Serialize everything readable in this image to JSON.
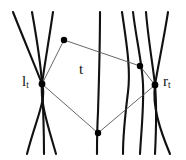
{
  "figure": {
    "background": "#ffffff",
    "width": 186,
    "height": 160,
    "curve_color": "#111111",
    "polygon_color": "#555555",
    "node_color": "#000000"
  },
  "labels": {
    "left_node": {
      "base": "l",
      "sub": "t",
      "x": 22,
      "y": 74
    },
    "right_node": {
      "base": "r",
      "sub": "t",
      "x": 163,
      "y": 74
    },
    "region": {
      "base": "t",
      "sub": "",
      "x": 79,
      "y": 62
    }
  },
  "nodes": [
    {
      "name": "left-node",
      "id": "l_t",
      "x": 42,
      "y": 84,
      "r": 3.4
    },
    {
      "name": "top-node",
      "id": "p1",
      "x": 64,
      "y": 40,
      "r": 3.2
    },
    {
      "name": "upper-right-node",
      "id": "p2",
      "x": 140,
      "y": 66,
      "r": 3.2
    },
    {
      "name": "right-node",
      "id": "r_t",
      "x": 155,
      "y": 85,
      "r": 3.4
    },
    {
      "name": "bottom-node",
      "id": "p3",
      "x": 98,
      "y": 133,
      "r": 3.2
    }
  ],
  "polygon": {
    "name": "region-t",
    "vertices": "42,84 64,40 140,66 155,85 98,133",
    "stroke": "#555555",
    "stroke_width": 0.9,
    "fill": "none"
  },
  "curves": [
    {
      "name": "curve-l1",
      "d": "M 13,12 C 24,40 36,68 42,84 C 47,99 36,119 27,154"
    },
    {
      "name": "curve-l2",
      "d": "M 32,12 C 37,40 41,68 42,84 C 43,104 44,126 44,154"
    },
    {
      "name": "curve-l3",
      "d": "M 53,12 C 49,40 44,68 42,84 C 40,102 48,126 56,154"
    },
    {
      "name": "curve-c1",
      "d": "M 100,12 C 100,45 99,80 98,112 C 97,130 97,142 97,154"
    },
    {
      "name": "curve-c2",
      "d": "M 122,12 C 126,40 131,68 128,92 C 125,116 123,138 123,154"
    },
    {
      "name": "curve-c3",
      "d": "M 133,12 C 136,38 142,62 143,84 C 144,108 141,134 140,154"
    },
    {
      "name": "curve-r1",
      "d": "M 146,12 C 148,38 153,66 155,85 C 157,108 156,134 155,154"
    },
    {
      "name": "curve-r2",
      "d": "M 168,12 C 164,38 158,66 155,85 C 152,106 160,130 170,154"
    }
  ]
}
